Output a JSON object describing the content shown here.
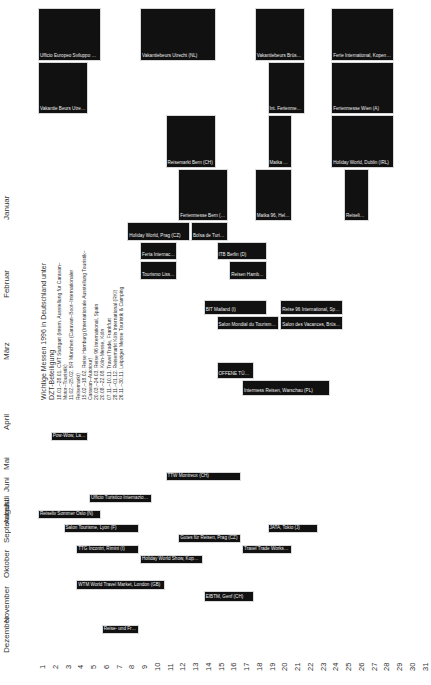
{
  "chart_data": {
    "type": "table",
    "title": "Wichtige Messen 1996 in Deutschland unter DZT-Beteiligung",
    "xlabel": "Tag",
    "ylabel": "Monat",
    "days": [
      "1",
      "2",
      "3",
      "4",
      "5",
      "6",
      "7",
      "8",
      "9",
      "10",
      "11",
      "12",
      "13",
      "14",
      "15",
      "16",
      "17",
      "18",
      "19",
      "20",
      "21",
      "22",
      "23",
      "24",
      "25",
      "26",
      "27",
      "28",
      "29",
      "30",
      "31"
    ],
    "months": [
      "Januar",
      "Februar",
      "März",
      "April",
      "Mai",
      "Juni",
      "Juli",
      "August",
      "September",
      "Oktober",
      "November",
      "Dezember"
    ],
    "info_box": {
      "title": "Wichtige Messen 1996 in Deutschland unter DZT-Beteiligung",
      "entries": [
        {
          "dates": "18.01.–28.01.",
          "text": "CMT Stuttgart (Intern. Ausstellung für Caravan–Motor–Touristik)"
        },
        {
          "dates": "11.02.–25.02.",
          "text": "BR München (Caravan–Boot–Internationaler Reisemarkt)"
        },
        {
          "dates": "15.02.–18.02.",
          "text": "Reise Hamburg (Internationale Ausstellung Touristik–Caravan–Autotour)"
        },
        {
          "dates": "20.03.–24.03.",
          "text": "Reise 96 International, Spain"
        },
        {
          "dates": "20.08.–22.08.",
          "text": "Köln-Messe, Köln"
        },
        {
          "dates": "07.11.–10.11.",
          "text": "Travel Trade, Frankfurt"
        },
        {
          "dates": "28.11.–01.12.",
          "text": "Reisemarkt Köln International (RKI)"
        },
        {
          "dates": "26.11.–30.11.",
          "text": "Leipziger Messe Touristik & Camping"
        }
      ]
    },
    "events": [
      {
        "month": "Januar",
        "start": 1,
        "end": 5,
        "col": 0,
        "label": "Ufficio Europeo Sviluppo Enti Turismo, Madrid (E)"
      },
      {
        "month": "Januar",
        "start": 1,
        "end": 4,
        "col": 1,
        "label": "Vakantie Beurs Utrecht (NL)"
      },
      {
        "month": "Januar",
        "start": 9,
        "end": 14,
        "col": 0,
        "label": "Vakantiebeurs Utrecht (NL)"
      },
      {
        "month": "Januar",
        "start": 11,
        "end": 14,
        "col": 2,
        "label": "Reisemarkt Bern (CH)"
      },
      {
        "month": "Januar",
        "start": 12,
        "end": 15,
        "col": 3,
        "label": "Ferienmesse Bern (CH)"
      },
      {
        "month": "Januar",
        "start": 18,
        "end": 21,
        "col": 0,
        "label": "Vakantiebeurs Brüssel (B)"
      },
      {
        "month": "Januar",
        "start": 19,
        "end": 21,
        "col": 1,
        "label": "Int. Ferienmesse Basel (CH)"
      },
      {
        "month": "Januar",
        "start": 19,
        "end": 20,
        "col": 2,
        "label": "Matka 96, Helsinki (SF)"
      },
      {
        "month": "Januar",
        "start": 18,
        "end": 20,
        "col": 3,
        "label": "Matka 96, Helsinki (SF)"
      },
      {
        "month": "Januar",
        "start": 24,
        "end": 28,
        "col": 0,
        "label": "Ferie International, Kopenhagen (DK)"
      },
      {
        "month": "Januar",
        "start": 24,
        "end": 28,
        "col": 1,
        "label": "Ferienmesse Wien (A)"
      },
      {
        "month": "Januar",
        "start": 24,
        "end": 28,
        "col": 2,
        "label": "Holiday World, Dublin (IRL)"
      },
      {
        "month": "Januar",
        "start": 25,
        "end": 26,
        "col": 3,
        "label": "Reiseliv Oslo (N)"
      },
      {
        "month": "Februar",
        "start": 8,
        "end": 12,
        "col": 0,
        "label": "Holiday World, Prag (CZ)"
      },
      {
        "month": "Februar",
        "start": 9,
        "end": 11,
        "col": 1,
        "label": "Feria Internacional de Turismo, Madrid (E)"
      },
      {
        "month": "Februar",
        "start": 9,
        "end": 11,
        "col": 2,
        "label": "Tourismo Lissabon (P)"
      },
      {
        "month": "Februar",
        "start": 13,
        "end": 15,
        "col": 0,
        "label": "Bolsa de Turismo, Lissabon (P)"
      },
      {
        "month": "Februar",
        "start": 15,
        "end": 18,
        "col": 1,
        "label": "ITB Berlin (D)"
      },
      {
        "month": "Februar",
        "start": 16,
        "end": 18,
        "col": 2,
        "label": "Reisen Hamburg (D)"
      },
      {
        "month": "März",
        "start": 14,
        "end": 18,
        "col": 0,
        "label": "BIT Mailand (I)"
      },
      {
        "month": "März",
        "start": 15,
        "end": 19,
        "col": 1,
        "label": "Salon Mondial du Tourisme, Paris (F)"
      },
      {
        "month": "März",
        "start": 20,
        "end": 24,
        "col": 0,
        "label": "Reise 96 International, Spain"
      },
      {
        "month": "März",
        "start": 20,
        "end": 24,
        "col": 1,
        "label": "Salon des Vacances, Brüssel (B)"
      },
      {
        "month": "April",
        "start": 15,
        "end": 17,
        "col": 0,
        "label": "OFFENE TÜR, Zürich (CH)"
      },
      {
        "month": "April",
        "start": 17,
        "end": 23,
        "col": 1,
        "label": "Intermess Reisen, Warschau (PL)"
      },
      {
        "month": "Mai",
        "start": 2,
        "end": 4,
        "col": 0,
        "label": "Pow-Wow, Las Vegas (USA)"
      },
      {
        "month": "Juni",
        "start": 11,
        "end": 16,
        "col": 0,
        "label": "TTW Montreux (CH)"
      },
      {
        "month": "Juli",
        "start": 5,
        "end": 9,
        "col": 0,
        "label": "Ufficio Turistico Internazionale, Rimini (I)"
      },
      {
        "month": "August",
        "start": 1,
        "end": 5,
        "col": 0,
        "label": "Reiseliv Sommer Oslo (N)"
      },
      {
        "month": "September",
        "start": 3,
        "end": 8,
        "col": 0,
        "label": "Salon Tourisme, Lyon (F)"
      },
      {
        "month": "September",
        "start": 12,
        "end": 16,
        "col": 1,
        "label": "Gutes für Reisen, Prag (CZ)"
      },
      {
        "month": "September",
        "start": 19,
        "end": 22,
        "col": 0,
        "label": "JATA, Tokio (J)"
      },
      {
        "month": "Oktober",
        "start": 4,
        "end": 8,
        "col": 0,
        "label": "TTG Incontri, Rimini (I)"
      },
      {
        "month": "Oktober",
        "start": 9,
        "end": 13,
        "col": 1,
        "label": "Holiday World Show, Kopenhagen (DK)"
      },
      {
        "month": "Oktober",
        "start": 17,
        "end": 20,
        "col": 0,
        "label": "Travel Trade Workshop, Montreux (CH)"
      },
      {
        "month": "November",
        "start": 4,
        "end": 10,
        "col": 0,
        "label": "WTM World Travel Market, London (GB)"
      },
      {
        "month": "November",
        "start": 14,
        "end": 17,
        "col": 1,
        "label": "EIBTM, Genf (CH)"
      },
      {
        "month": "Dezember",
        "start": 6,
        "end": 8,
        "col": 0,
        "label": "Reise- und Freizeitmesse, Essen (D)"
      }
    ]
  },
  "axis": {
    "day_labels": [
      "1",
      "2",
      "3",
      "4",
      "5",
      "6",
      "7",
      "8",
      "9",
      "10",
      "11",
      "12",
      "13",
      "14",
      "15",
      "16",
      "17",
      "18",
      "19",
      "20",
      "21",
      "22",
      "23",
      "24",
      "25",
      "26",
      "27",
      "28",
      "29",
      "30",
      "31"
    ],
    "month_labels": [
      "Januar",
      "Februar",
      "März",
      "April",
      "Mai",
      "Juni",
      "Juli",
      "August",
      "September",
      "Oktober",
      "November",
      "Dezember"
    ]
  },
  "info": {
    "title": "Wichtige Messen 1996 in Deutschland unter DZT-Beteiligung",
    "rows": [
      "18.01.–28.01.  CMT Stuttgart (Intern. Ausstellung für Caravan–Motor–Touristik)",
      "11.02.–25.02.  BR München (Caravan–Boot–Internationaler Reisemarkt)",
      "15.02.–18.02.  Reise Hamburg (Internationale Ausstellung Touristik–Caravan–Autotour)",
      "20.03.–24.03.  Reise 96 International, Spain",
      "20.08.–22.08.  Köln-Messe, Köln",
      "07.11.–10.11.  Travel Trade, Frankfurt",
      "28.11.–01.12.  Reisemarkt Köln International (RKI)",
      "26.11.–30.11.  Leipziger Messe Touristik & Camping"
    ]
  },
  "colors": {
    "bar": "#111111",
    "bar_text": "#eeeeee",
    "axis_text": "#333333",
    "background": "#ffffff"
  }
}
